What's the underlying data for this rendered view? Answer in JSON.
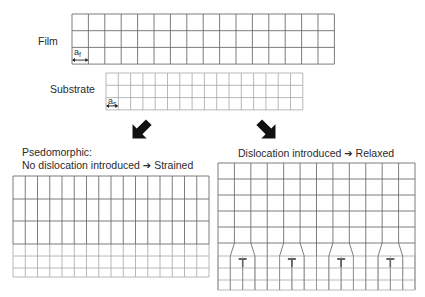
{
  "labels": {
    "film": "Film",
    "substrate": "Substrate",
    "film_param": "a",
    "film_param_sub": "f",
    "substrate_param": "a",
    "substrate_param_sub": "s",
    "left_title_line1": "Psedomorphic:",
    "left_title_line2_a": "No dislocation introduced",
    "left_title_line2_b": "Strained",
    "right_title_a": "Dislocation introduced",
    "right_title_b": "Relaxed",
    "arrow_glyph": "➔",
    "dislocation_symbol": "T"
  },
  "colors": {
    "film_line": "#6e6e6e",
    "substrate_line": "#a6a6a6",
    "arrow": "#111111"
  },
  "film_grid": {
    "x": 72,
    "y": 14,
    "cols": 16,
    "rows": 3,
    "cell_w": 16.4,
    "cell_h": 16.7
  },
  "substrate_grid": {
    "x": 106,
    "y": 73,
    "cols": 16,
    "rows": 3,
    "cell_w": 12.3,
    "cell_h": 12.3
  },
  "strained": {
    "x": 13,
    "cols": 16,
    "cell_w": 12.25,
    "film_rows_y": [
      176,
      199,
      221,
      244
    ],
    "sub_rows_y": [
      244,
      256,
      268,
      277
    ]
  },
  "relaxed": {
    "x0": 218,
    "x1": 415,
    "film_cols": 12,
    "film_rows_y": [
      163,
      179,
      195,
      211,
      227,
      243
    ],
    "interface_y": 256,
    "sub_rows_y": [
      256,
      268,
      280,
      290
    ],
    "sub_cols": 16,
    "dislocation_count": 4
  },
  "arrows": [
    {
      "name": "arrow-down-left",
      "x": 141,
      "y": 130,
      "rot": 135
    },
    {
      "name": "arrow-down-right",
      "x": 267,
      "y": 130,
      "rot": 45
    }
  ]
}
